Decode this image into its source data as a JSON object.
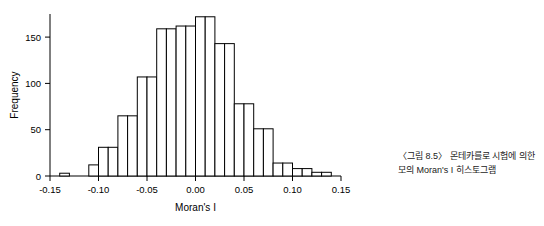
{
  "caption": {
    "line1": "〈그림 8.5〉 몬테카를로 시험에 의한",
    "line2": "모의 Moran's I 히스토그램"
  },
  "chart_data": {
    "type": "bar",
    "title": "",
    "xlabel": "Moran's I",
    "ylabel": "Frequency",
    "xlim": [
      -0.15,
      0.15
    ],
    "ylim": [
      0,
      175
    ],
    "xticks": [
      "-0.15",
      "-0.10",
      "-0.05",
      "0.00",
      "0.05",
      "0.10",
      "0.15"
    ],
    "xtick_values": [
      -0.15,
      -0.1,
      -0.05,
      0.0,
      0.05,
      0.1,
      0.15
    ],
    "yticks": [
      "0",
      "50",
      "100",
      "150"
    ],
    "ytick_values": [
      0,
      50,
      100,
      150
    ],
    "grid": false,
    "legend": "none",
    "bin_width": 0.01,
    "bin_starts": [
      -0.14,
      -0.13,
      -0.12,
      -0.11,
      -0.1,
      -0.09,
      -0.08,
      -0.07,
      -0.06,
      -0.05,
      -0.04,
      -0.03,
      -0.02,
      -0.01,
      0.0,
      0.01,
      0.02,
      0.03,
      0.04,
      0.05,
      0.06,
      0.07,
      0.08,
      0.09,
      0.1,
      0.11,
      0.12,
      0.13
    ],
    "categories": [
      "-0.135",
      "-0.125",
      "-0.115",
      "-0.105",
      "-0.095",
      "-0.085",
      "-0.075",
      "-0.065",
      "-0.055",
      "-0.045",
      "-0.035",
      "-0.025",
      "-0.015",
      "-0.005",
      "0.005",
      "0.015",
      "0.025",
      "0.035",
      "0.045",
      "0.055",
      "0.065",
      "0.075",
      "0.085",
      "0.095",
      "0.105",
      "0.115",
      "0.125",
      "0.135"
    ],
    "values": [
      3,
      0,
      0,
      12,
      31,
      31,
      65,
      65,
      107,
      107,
      159,
      159,
      162,
      162,
      172,
      172,
      143,
      143,
      78,
      78,
      51,
      51,
      14,
      14,
      8,
      8,
      4,
      4
    ]
  }
}
